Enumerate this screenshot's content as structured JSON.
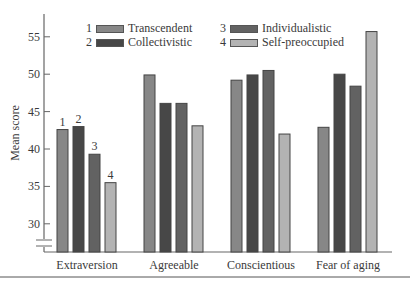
{
  "chart_data": {
    "type": "bar",
    "title": "",
    "xlabel": "",
    "ylabel": "Mean score",
    "ylim": [
      26,
      57
    ],
    "yticks": [
      30,
      35,
      40,
      45,
      50,
      55
    ],
    "axis_break": true,
    "grid": false,
    "legend_position": "top",
    "categories": [
      "Extraversion",
      "Agreeable",
      "Conscientious",
      "Fear of aging"
    ],
    "series": [
      {
        "id": "1",
        "name": "Transcendent",
        "color": "#878787",
        "values": [
          42.6,
          49.9,
          49.2,
          42.9
        ]
      },
      {
        "id": "2",
        "name": "Collectivistic",
        "color": "#474747",
        "values": [
          43.0,
          46.1,
          49.9,
          50.0
        ]
      },
      {
        "id": "3",
        "name": "Individualistic",
        "color": "#626262",
        "values": [
          39.3,
          46.1,
          50.5,
          48.4
        ]
      },
      {
        "id": "4",
        "name": "Self-preoccupied",
        "color": "#b3b3b3",
        "values": [
          35.5,
          43.1,
          42.0,
          55.7
        ]
      }
    ],
    "bar_number_labels_group": "Extraversion"
  },
  "legend": {
    "items": [
      {
        "num": "1",
        "label": "Transcendent"
      },
      {
        "num": "2",
        "label": "Collectivistic"
      },
      {
        "num": "3",
        "label": "Individualistic"
      },
      {
        "num": "4",
        "label": "Self-preoccupied"
      }
    ]
  }
}
